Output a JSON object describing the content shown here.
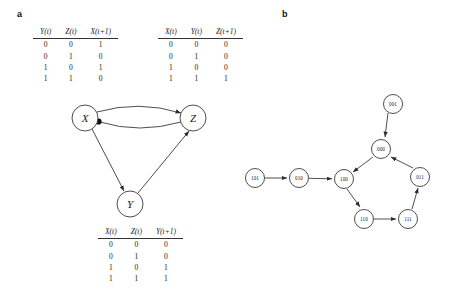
{
  "panels": {
    "a": {
      "label": "a"
    },
    "b": {
      "label": "b"
    }
  },
  "tables": [
    {
      "id": "table-x",
      "name": "truth-table-x",
      "headers": [
        "Y(t)",
        "Z(t)",
        "X(t+1)"
      ],
      "rows": [
        [
          "0",
          "0",
          "1"
        ],
        [
          "0",
          "1",
          "0"
        ],
        [
          "1",
          "0",
          "1"
        ],
        [
          "1",
          "1",
          "0"
        ]
      ]
    },
    {
      "id": "table-z",
      "name": "truth-table-z",
      "headers": [
        "X(t)",
        "Y(t)",
        "Z(t+1)"
      ],
      "rows": [
        [
          "0",
          "0",
          "0"
        ],
        [
          "0",
          "1",
          "0"
        ],
        [
          "1",
          "0",
          "0"
        ],
        [
          "1",
          "1",
          "1"
        ]
      ]
    },
    {
      "id": "table-y",
      "name": "truth-table-y",
      "headers": [
        "X(t)",
        "Z(t)",
        "Y(t+1)"
      ],
      "rows": [
        [
          "0",
          "0",
          "0"
        ],
        [
          "0",
          "1",
          "0"
        ],
        [
          "1",
          "0",
          "1"
        ],
        [
          "1",
          "1",
          "1"
        ]
      ]
    }
  ],
  "wiring_diagram": {
    "nodes": [
      {
        "id": "X",
        "label": "X",
        "cx": 55,
        "cy": 23
      },
      {
        "id": "Z",
        "label": "Z",
        "cx": 163,
        "cy": 23
      },
      {
        "id": "Y",
        "label": "Y",
        "cx": 100,
        "cy": 109
      }
    ],
    "edges": [
      {
        "from": "X",
        "to": "Z",
        "kind": "activation"
      },
      {
        "from": "Z",
        "to": "X",
        "kind": "repression"
      },
      {
        "from": "X",
        "to": "Y",
        "kind": "activation"
      },
      {
        "from": "Y",
        "to": "Z",
        "kind": "activation"
      }
    ]
  },
  "state_graph": {
    "nodes": [
      {
        "id": "101",
        "label": "101",
        "cx": 15,
        "cy": 93
      },
      {
        "id": "010",
        "label": "010",
        "cx": 59,
        "cy": 93
      },
      {
        "id": "100",
        "label": "100",
        "cx": 104,
        "cy": 94
      },
      {
        "id": "000",
        "label": "000",
        "cx": 141,
        "cy": 64
      },
      {
        "id": "001",
        "label": "001",
        "cx": 153,
        "cy": 19
      },
      {
        "id": "011",
        "label": "011",
        "cx": 180,
        "cy": 92
      },
      {
        "id": "111",
        "label": "111",
        "cx": 168,
        "cy": 134
      },
      {
        "id": "110",
        "label": "110",
        "cx": 124,
        "cy": 134
      }
    ],
    "edges": [
      {
        "from": "101",
        "to": "010"
      },
      {
        "from": "010",
        "to": "100"
      },
      {
        "from": "001",
        "to": "000"
      },
      {
        "from": "000",
        "to": "100"
      },
      {
        "from": "100",
        "to": "110"
      },
      {
        "from": "110",
        "to": "111"
      },
      {
        "from": "111",
        "to": "011"
      },
      {
        "from": "011",
        "to": "000"
      }
    ]
  },
  "colors": {
    "ink": "#1a1a1a",
    "stroke": "#3a3a3a",
    "background": "#ffffff"
  }
}
